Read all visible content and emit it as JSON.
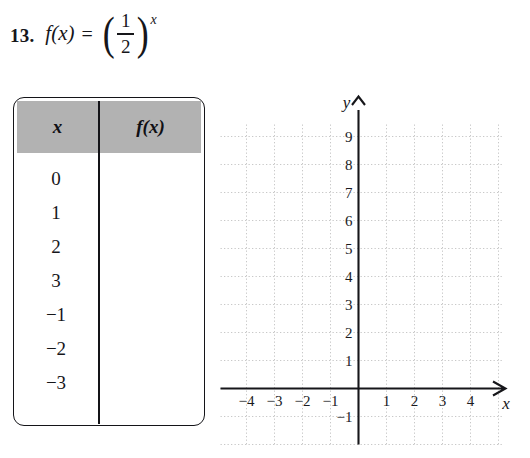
{
  "problem": {
    "number": "13.",
    "function_name": "f(x)",
    "equals": "=",
    "left_paren": "(",
    "right_paren": ")",
    "fraction_numerator": "1",
    "fraction_denominator": "2",
    "exponent": "x",
    "full_text": "13. f(x) = (1/2)^x"
  },
  "table": {
    "headers": [
      "x",
      "f(x)"
    ],
    "rows": [
      {
        "x": "0",
        "fx": ""
      },
      {
        "x": "1",
        "fx": ""
      },
      {
        "x": "2",
        "fx": ""
      },
      {
        "x": "3",
        "fx": ""
      },
      {
        "x": "−1",
        "fx": ""
      },
      {
        "x": "−2",
        "fx": ""
      },
      {
        "x": "−3",
        "fx": ""
      }
    ],
    "header_fill": "#b2b2b2",
    "border_color": "#141418"
  },
  "chart_data": {
    "type": "scatter",
    "title": "",
    "xlabel": "x",
    "ylabel": "y",
    "series": [],
    "x_ticks": [
      "−4",
      "−3",
      "−2",
      "−1",
      "1",
      "2",
      "3",
      "4"
    ],
    "x_tick_values": [
      -4,
      -3,
      -2,
      -1,
      1,
      2,
      3,
      4
    ],
    "y_ticks": [
      "9",
      "8",
      "7",
      "6",
      "5",
      "4",
      "3",
      "2",
      "1",
      "−1"
    ],
    "y_tick_values": [
      9,
      8,
      7,
      6,
      5,
      4,
      3,
      2,
      1,
      -1
    ],
    "xlim": [
      -5,
      5
    ],
    "ylim": [
      -2,
      10
    ],
    "grid": true,
    "grid_style": "dotted",
    "grid_color": "#c8c8c8",
    "axis_color": "#16161a",
    "legend": "none",
    "note": "Empty coordinate grid provided for plotting f(x) = (1/2)^x"
  }
}
